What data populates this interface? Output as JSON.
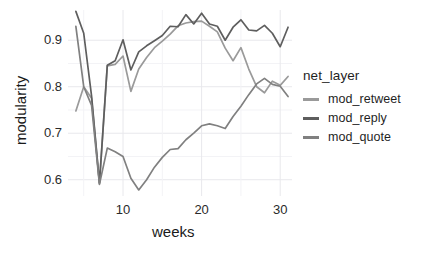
{
  "chart_data": {
    "type": "line",
    "title": "",
    "xlabel": "weeks",
    "ylabel": "modularity",
    "xlim": [
      3,
      31.5
    ],
    "ylim": [
      0.565,
      0.965
    ],
    "xticks": [
      10,
      20,
      30
    ],
    "yticks": [
      0.6,
      0.7,
      0.8,
      0.9
    ],
    "ytick_labels": [
      "0.6",
      "0.7",
      "0.8",
      "0.9"
    ],
    "xtick_labels": [
      "10",
      "20",
      "30"
    ],
    "grid": true,
    "grid_color": "#e8e8ec",
    "panel_background": "#ffffff",
    "legend": {
      "title": "net_layer",
      "position": "right"
    },
    "x": [
      4,
      5,
      6,
      7,
      8,
      9,
      10,
      11,
      12,
      13,
      14,
      15,
      16,
      17,
      18,
      19,
      20,
      21,
      22,
      23,
      24,
      25,
      26,
      27,
      28,
      29,
      30,
      31
    ],
    "series": [
      {
        "name": "mod_retweet",
        "color": "#9a9a9a",
        "values": [
          0.748,
          0.8,
          0.775,
          0.592,
          0.845,
          0.848,
          0.866,
          0.79,
          0.838,
          0.863,
          0.884,
          0.898,
          0.913,
          0.931,
          0.937,
          0.94,
          0.941,
          0.93,
          0.918,
          0.883,
          0.856,
          0.884,
          0.838,
          0.8,
          0.787,
          0.812,
          0.803,
          0.822
        ]
      },
      {
        "name": "mod_reply",
        "color": "#5e5e5e",
        "values": [
          0.962,
          0.915,
          0.78,
          0.593,
          0.846,
          0.856,
          0.901,
          0.836,
          0.875,
          0.888,
          0.899,
          0.91,
          0.93,
          0.929,
          0.955,
          0.935,
          0.958,
          0.935,
          0.93,
          0.9,
          0.928,
          0.944,
          0.922,
          0.92,
          0.932,
          0.915,
          0.886,
          0.928
        ]
      },
      {
        "name": "mod_quote",
        "color": "#808080",
        "values": [
          0.93,
          0.8,
          0.76,
          0.59,
          0.668,
          0.66,
          0.65,
          0.603,
          0.578,
          0.6,
          0.627,
          0.648,
          0.665,
          0.667,
          0.686,
          0.7,
          0.716,
          0.72,
          0.716,
          0.71,
          0.736,
          0.758,
          0.783,
          0.806,
          0.818,
          0.805,
          0.801,
          0.779
        ]
      }
    ]
  },
  "axes": {
    "y_title": "modularity",
    "x_title": "weeks"
  },
  "legend_items": [
    {
      "label": "mod_retweet",
      "color": "#9a9a9a"
    },
    {
      "label": "mod_reply",
      "color": "#5e5e5e"
    },
    {
      "label": "mod_quote",
      "color": "#808080"
    }
  ]
}
